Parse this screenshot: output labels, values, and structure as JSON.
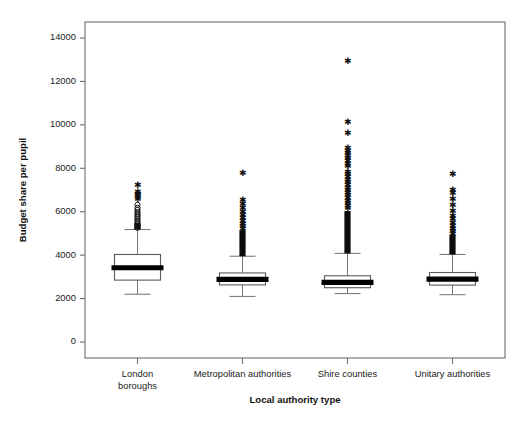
{
  "chart_data": {
    "type": "box",
    "title": "",
    "xlabel": "Local authority type",
    "ylabel": "Budget share per pupil",
    "ylim": [
      0,
      15000
    ],
    "yticks": [
      0,
      2000,
      4000,
      6000,
      8000,
      10000,
      12000,
      14000
    ],
    "ytick_labels": [
      "0",
      "2000",
      "4000",
      "6000",
      "8000",
      "10000",
      "12000",
      "14000"
    ],
    "grid": false,
    "legend": null,
    "categories": [
      "London boroughs",
      "Metropolitan authorities",
      "Shire counties",
      "Unitary authorities"
    ],
    "category_lines": [
      [
        "London",
        "boroughs"
      ],
      [
        "Metropolitan authorities"
      ],
      [
        "Shire counties"
      ],
      [
        "Unitary authorities"
      ]
    ],
    "boxes": [
      {
        "category": "London boroughs",
        "whisker_low": 2200,
        "q1": 2850,
        "median": 3420,
        "q3": 4030,
        "whisker_high": 5180,
        "outlier_marker": "mixed-star-and-circle",
        "outliers_star": [
          7180,
          6860,
          6800,
          6750,
          6630,
          6540
        ],
        "outliers_circle": [
          6320,
          6180,
          6080,
          5980,
          5900,
          5820,
          5740,
          5660,
          5580,
          5500,
          5420,
          5340,
          5260
        ],
        "extreme_outlier_max": 7180
      },
      {
        "category": "Metropolitan authorities",
        "whisker_low": 2100,
        "q1": 2630,
        "median": 2880,
        "q3": 3180,
        "whisker_high": 3950,
        "outlier_marker": "star",
        "outliers_star": [
          7740,
          6500,
          6300,
          6120,
          5960,
          5800,
          5660,
          5540,
          5420,
          5300,
          5180,
          5060,
          4960,
          4860,
          4760,
          4680,
          4600,
          4520,
          4450,
          4380,
          4310,
          4250,
          4190,
          4140,
          4090,
          4050,
          4010,
          3980
        ],
        "extreme_outlier_max": 7740
      },
      {
        "category": "Shire counties",
        "whisker_low": 2230,
        "q1": 2500,
        "median": 2750,
        "q3": 3050,
        "whisker_high": 4080,
        "outlier_marker": "star",
        "outliers_star": [
          12900,
          10100,
          9600,
          8900,
          8780,
          8660,
          8540,
          8420,
          8300,
          8180,
          8060,
          7800,
          7680,
          7560,
          7440,
          7320,
          7200,
          7080,
          6960,
          6840,
          6720,
          6600,
          6480,
          6360,
          6240,
          6120,
          6000,
          5880,
          5760,
          5640,
          5520,
          5400,
          5280,
          5160,
          5040,
          4920,
          4800,
          4700,
          4600,
          4500,
          4420,
          4340,
          4260,
          4200,
          4150
        ],
        "extreme_outlier_max": 12900
      },
      {
        "category": "Unitary authorities",
        "whisker_low": 2180,
        "q1": 2620,
        "median": 2900,
        "q3": 3200,
        "whisker_high": 4030,
        "outlier_marker": "star",
        "outliers_star": [
          7680,
          6980,
          6840,
          6560,
          6280,
          6020,
          5780,
          5620,
          5460,
          5320,
          5180,
          5060,
          4940,
          4840,
          4740,
          4650,
          4560,
          4480,
          4400,
          4330,
          4260,
          4200,
          4140,
          4090
        ],
        "extreme_outlier_max": 7680
      }
    ],
    "colors": {
      "background": "#ffffff",
      "axis": "#6e6e6e",
      "box_fill": "#ffffff",
      "box_edge": "#5a5a5a",
      "median": "#000000",
      "outlier": "#111111"
    }
  }
}
